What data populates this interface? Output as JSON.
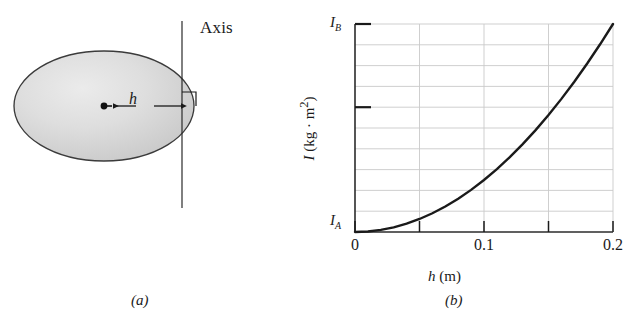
{
  "figure": {
    "panel_a": {
      "caption": "(a)",
      "axis_label": "Axis",
      "distance_label": "h",
      "center_point_name": "center-of-mass-dot",
      "shape": "ellipse",
      "shape_fill": "#d8d8d8",
      "shape_stroke": "#3a3a3a"
    },
    "panel_b": {
      "caption": "(b)",
      "ylabel_symbol": "I",
      "ylabel_units": "(kg · m2)",
      "ylabel_full": "I (kg · m²)",
      "xlabel_symbol": "h",
      "xlabel_units": "(m)",
      "xlabel_full": "h (m)",
      "ytick_low": "I",
      "ytick_low_sub": "A",
      "ytick_high": "I",
      "ytick_high_sub": "B",
      "curve_color": "#1a1a1a",
      "grid_color": "#c9c9c9",
      "frame_color": "#2b2b2b"
    }
  },
  "chart_data": {
    "type": "line",
    "title": "",
    "subtitle": "",
    "xlabel": "h (m)",
    "ylabel": "I (kg · m²)",
    "xlim": [
      0,
      0.2
    ],
    "ylim": [
      0,
      1
    ],
    "grid": true,
    "legend": null,
    "x_ticks": [
      0,
      0.05,
      0.1,
      0.15,
      0.2
    ],
    "x_tick_labels": [
      "0",
      "",
      "0.1",
      "",
      "0.2"
    ],
    "y_ticks": [
      0,
      0.6,
      1
    ],
    "y_tick_labels": [
      "I_A",
      "",
      "I_B"
    ],
    "y_gridlines_count": 10,
    "annotations": [
      "I_A is the minimum moment of inertia at h = 0",
      "I_B is the moment of inertia at h = 0.2 m",
      "Curve is parabolic: I = I_A + M h^2 (parallel-axis theorem)"
    ],
    "series": [
      {
        "name": "I vs h",
        "x": [
          0,
          0.01,
          0.02,
          0.03,
          0.04,
          0.05,
          0.06,
          0.07,
          0.08,
          0.09,
          0.1,
          0.11,
          0.12,
          0.13,
          0.14,
          0.15,
          0.16,
          0.17,
          0.18,
          0.19,
          0.2
        ],
        "y": [
          0,
          0.0025,
          0.01,
          0.0225,
          0.04,
          0.0625,
          0.09,
          0.1225,
          0.16,
          0.2025,
          0.25,
          0.3025,
          0.36,
          0.4225,
          0.49,
          0.5625,
          0.64,
          0.7225,
          0.81,
          0.9025,
          1.0
        ]
      }
    ]
  }
}
